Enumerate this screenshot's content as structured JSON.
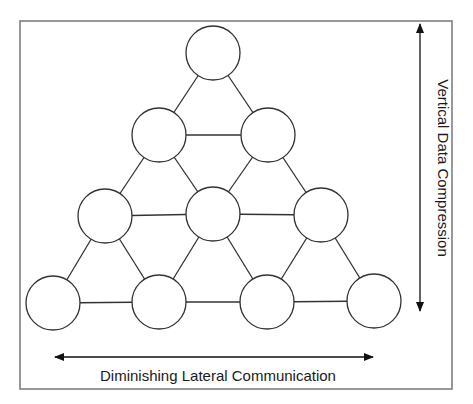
{
  "diagram": {
    "type": "hierarchy-pyramid",
    "labels": {
      "horizontal_axis": "Diminishing Lateral Communication",
      "vertical_axis": "Vertical Data Compression"
    },
    "rows": [
      {
        "level": 1,
        "nodes": 1
      },
      {
        "level": 2,
        "nodes": 2
      },
      {
        "level": 3,
        "nodes": 3
      },
      {
        "level": 4,
        "nodes": 4
      }
    ],
    "colors": {
      "stroke": "#333333",
      "frame": "#666666",
      "fill": "#ffffff"
    }
  }
}
